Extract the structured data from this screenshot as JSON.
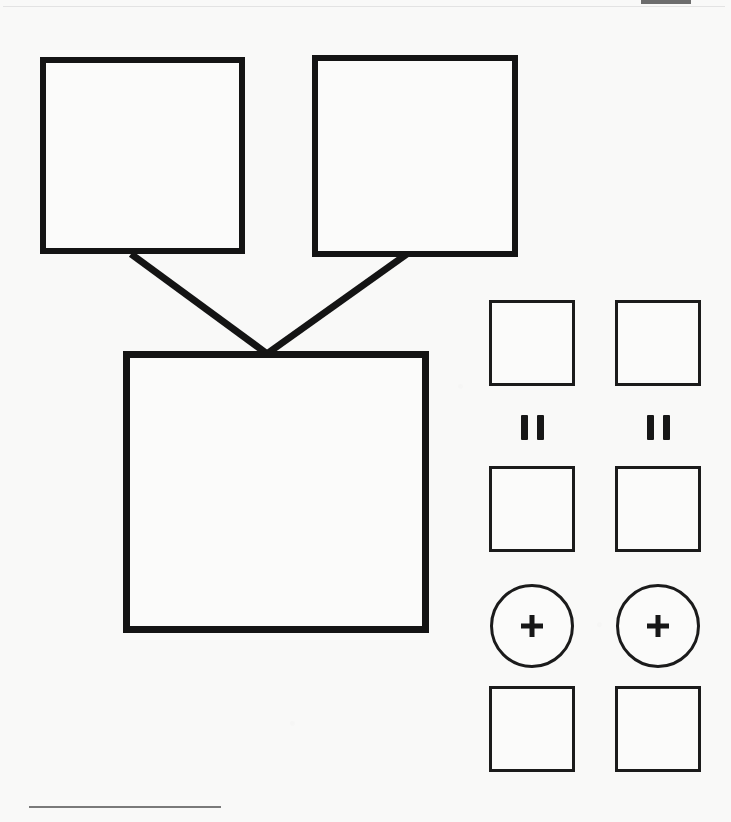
{
  "page": {
    "background_color": "#f9f9f8",
    "ink_color": "#141414",
    "width": 731,
    "height": 822
  },
  "artifacts": {
    "top_rule_label": "scan edge line",
    "corner_bar_label": "scan corner marker",
    "bottom_rule_label": "footer rule"
  },
  "diagram": {
    "type": "hierarchy",
    "nodes": [
      {
        "id": "top-left",
        "label": "",
        "x": 40,
        "y": 57,
        "w": 205,
        "h": 197,
        "stroke": "#141414",
        "stroke_width": 6
      },
      {
        "id": "top-right",
        "label": "",
        "x": 312,
        "y": 55,
        "w": 206,
        "h": 202,
        "stroke": "#141414",
        "stroke_width": 6
      },
      {
        "id": "bottom",
        "label": "",
        "x": 123,
        "y": 351,
        "w": 306,
        "h": 282,
        "stroke": "#141414",
        "stroke_width": 7
      }
    ],
    "connectors": [
      {
        "from": "top-left",
        "to": "bottom",
        "x1": 131,
        "y1": 254,
        "x2": 266,
        "y2": 353
      },
      {
        "from": "top-right",
        "to": "bottom",
        "x1": 407,
        "y1": 254,
        "x2": 268,
        "y2": 353
      }
    ]
  },
  "palette": {
    "label": "shape palette",
    "rows": [
      {
        "id": "squares-row-1",
        "kind": "square",
        "items": [
          {
            "id": "sq-1a",
            "label": ""
          },
          {
            "id": "sq-1b",
            "label": ""
          }
        ]
      },
      {
        "id": "marks-row",
        "kind": "pause-mark",
        "items": [
          {
            "id": "mark-a",
            "label": ""
          },
          {
            "id": "mark-b",
            "label": ""
          }
        ]
      },
      {
        "id": "squares-row-2",
        "kind": "square",
        "items": [
          {
            "id": "sq-2a",
            "label": ""
          },
          {
            "id": "sq-2b",
            "label": ""
          }
        ]
      },
      {
        "id": "circles-row",
        "kind": "plus-circle",
        "items": [
          {
            "id": "circle-a",
            "glyph": "+"
          },
          {
            "id": "circle-b",
            "glyph": "+"
          }
        ]
      },
      {
        "id": "squares-row-3",
        "kind": "square",
        "items": [
          {
            "id": "sq-3a",
            "label": ""
          },
          {
            "id": "sq-3b",
            "label": ""
          }
        ]
      }
    ]
  }
}
